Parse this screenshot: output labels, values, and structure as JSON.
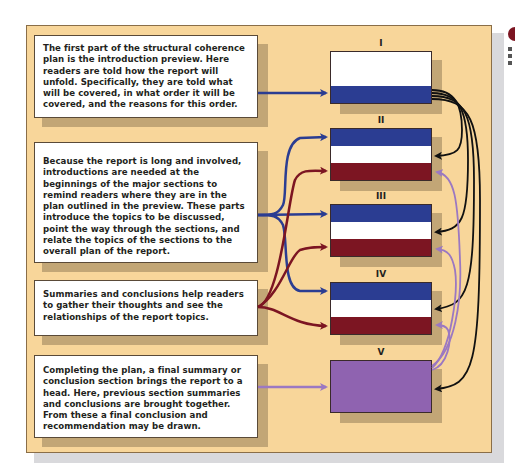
{
  "diagram": {
    "text_boxes": [
      {
        "id": "preview",
        "text": "The first part of the structural coherence plan is the introduction preview.  Here readers are told how the report will unfold.  Specifically, they are told what will be covered, in what order it will be covered, and the reasons for this order."
      },
      {
        "id": "section-introductions",
        "text": "Because the report is long and involved, introductions are needed at the beginnings of the major sections to remind readers where they are in the plan outlined in the preview. These parts introduce the topics to be discussed, point the way through the sections, and relate the topics of the sections to the overall plan of the report."
      },
      {
        "id": "summaries",
        "text": "Summaries and conclusions help readers to gather their thoughts and see the relationships of the report topics."
      },
      {
        "id": "final-summary",
        "text": "Completing the plan, a final summary or conclusion section brings the report to a head. Here, previous section summaries and conclusions are brought together. From these a final conclusion and recommendation may be drawn."
      }
    ],
    "sections": [
      {
        "label": "I",
        "bands": [
          "white",
          "blue"
        ],
        "band_ratio": [
          2,
          1
        ]
      },
      {
        "label": "II",
        "bands": [
          "blue",
          "white",
          "red"
        ]
      },
      {
        "label": "III",
        "bands": [
          "blue",
          "white",
          "red"
        ]
      },
      {
        "label": "IV",
        "bands": [
          "blue",
          "white",
          "red"
        ]
      },
      {
        "label": "V",
        "bands": [
          "purple"
        ]
      }
    ],
    "colors": {
      "panel": "#f8d69a",
      "intro_blue": "#2b3d92",
      "summary_red": "#7c1522",
      "final_purple": "#8f63b0",
      "preview_link_black": "#111111"
    },
    "connections": [
      {
        "from": "preview",
        "to": "I",
        "color": "blue"
      },
      {
        "from": "section-introductions",
        "to": [
          "II",
          "III",
          "IV"
        ],
        "color": "blue"
      },
      {
        "from": "summaries",
        "to": [
          "II",
          "III",
          "IV"
        ],
        "color": "red"
      },
      {
        "from": "final-summary",
        "to": "V",
        "color": "purple"
      },
      {
        "from": "I",
        "to": [
          "II",
          "III",
          "IV",
          "V"
        ],
        "color": "black"
      },
      {
        "from": "V",
        "to": [
          "II",
          "III",
          "IV"
        ],
        "color": "purple"
      }
    ]
  }
}
